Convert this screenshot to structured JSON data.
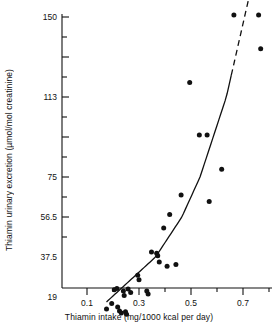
{
  "chart_data": {
    "type": "scatter",
    "title": "",
    "xlabel": "Thiamin intake (mg/1000 kcal per day)",
    "ylabel": "Thiamin urinary excretion (µmol/mol creatinine)",
    "xlim": [
      0.0,
      0.8
    ],
    "ylim_labels": [
      "19",
      "37.5",
      "56.5",
      "75",
      "113",
      "150"
    ],
    "y_scale": "nonlinear (approximately logarithmic)",
    "grid": false,
    "legend": null,
    "x_ticks_major": [
      0.1,
      0.3,
      0.5,
      0.7
    ],
    "x_ticks_major_labels": [
      "0.1",
      "0.3",
      "0.5",
      "0.7"
    ],
    "x_ticks_minor": [
      0.2,
      0.4,
      0.6,
      0.8
    ],
    "y_ticks_major_values": [
      19,
      37.5,
      56.5,
      75,
      113,
      150
    ],
    "y_ticks_minor_count_between": 1,
    "points": [
      {
        "x": 0.175,
        "y": 15.5
      },
      {
        "x": 0.195,
        "y": 17.0
      },
      {
        "x": 0.205,
        "y": 21.5
      },
      {
        "x": 0.215,
        "y": 22.0
      },
      {
        "x": 0.218,
        "y": 16.0
      },
      {
        "x": 0.225,
        "y": 15.0
      },
      {
        "x": 0.232,
        "y": 14.5
      },
      {
        "x": 0.24,
        "y": 21.0
      },
      {
        "x": 0.243,
        "y": 19.5
      },
      {
        "x": 0.248,
        "y": 14.8
      },
      {
        "x": 0.252,
        "y": 14.2
      },
      {
        "x": 0.258,
        "y": 21.8
      },
      {
        "x": 0.268,
        "y": 20.5
      },
      {
        "x": 0.295,
        "y": 27.5
      },
      {
        "x": 0.3,
        "y": 25.5
      },
      {
        "x": 0.33,
        "y": 21.0
      },
      {
        "x": 0.335,
        "y": 20.0
      },
      {
        "x": 0.348,
        "y": 39.5
      },
      {
        "x": 0.368,
        "y": 39.0
      },
      {
        "x": 0.372,
        "y": 38.0
      },
      {
        "x": 0.378,
        "y": 34.5
      },
      {
        "x": 0.395,
        "y": 50.5
      },
      {
        "x": 0.408,
        "y": 32.0
      },
      {
        "x": 0.418,
        "y": 57.5
      },
      {
        "x": 0.442,
        "y": 33.0
      },
      {
        "x": 0.462,
        "y": 66.0
      },
      {
        "x": 0.495,
        "y": 119.0
      },
      {
        "x": 0.532,
        "y": 93.0
      },
      {
        "x": 0.562,
        "y": 93.0
      },
      {
        "x": 0.57,
        "y": 63.0
      },
      {
        "x": 0.618,
        "y": 78.0
      },
      {
        "x": 0.665,
        "y": 151.0
      },
      {
        "x": 0.76,
        "y": 151.0
      },
      {
        "x": 0.768,
        "y": 134.0
      }
    ],
    "fit_curve": {
      "style_solid_range": [
        0.175,
        0.655
      ],
      "style_dashed_range": [
        0.655,
        0.775
      ],
      "description": "Fitted exponential regression curve, solid over the observed data range and dashed where extrapolated"
    }
  }
}
